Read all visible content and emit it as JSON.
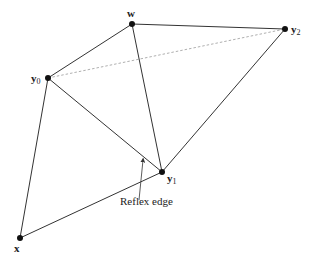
{
  "figure": {
    "caption_label": "Reflex edge",
    "colors": {
      "edge": "#333333",
      "dashed": "#9a9a9a",
      "vertex": "#111111",
      "background": "#ffffff"
    },
    "vertices": [
      {
        "id": "w",
        "label": "w",
        "sub": "",
        "x": 132,
        "y": 24
      },
      {
        "id": "y0",
        "label": "y",
        "sub": "0",
        "x": 48,
        "y": 78
      },
      {
        "id": "y1",
        "label": "y",
        "sub": "1",
        "x": 162,
        "y": 172
      },
      {
        "id": "y2",
        "label": "y",
        "sub": "2",
        "x": 285,
        "y": 29
      },
      {
        "id": "x",
        "label": "x",
        "sub": "",
        "x": 20,
        "y": 238
      }
    ],
    "edges": [
      {
        "from": "w",
        "to": "y0",
        "style": "solid"
      },
      {
        "from": "w",
        "to": "y2",
        "style": "solid"
      },
      {
        "from": "w",
        "to": "y1",
        "style": "solid"
      },
      {
        "from": "y0",
        "to": "y1",
        "style": "solid",
        "note": "reflex edge"
      },
      {
        "from": "y2",
        "to": "y1",
        "style": "solid"
      },
      {
        "from": "y0",
        "to": "x",
        "style": "solid"
      },
      {
        "from": "x",
        "to": "y1",
        "style": "solid"
      },
      {
        "from": "y0",
        "to": "y2",
        "style": "dashed"
      }
    ],
    "labels": {
      "w": "w",
      "y0": "y",
      "y0_sub": "0",
      "y1": "y",
      "y1_sub": "1",
      "y2": "y",
      "y2_sub": "2",
      "x": "x"
    }
  }
}
